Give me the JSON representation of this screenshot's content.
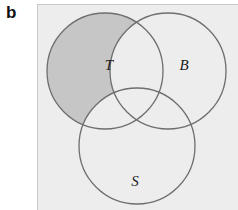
{
  "figure": {
    "panel_letter": "b",
    "type": "venn-diagram-3-set",
    "background_color": "#ededed",
    "page_background_color": "#ffffff"
  },
  "venn": {
    "stroke_color": "#6e6e6e",
    "stroke_width": 1.3,
    "unfilled_color": "#ededed",
    "highlight_color": "#c6c6c6",
    "sets": [
      {
        "id": "set-t",
        "label": "T",
        "label_x": 71,
        "label_y": 65,
        "cx": 67,
        "cy": 66,
        "r": 58,
        "highlighted": true
      },
      {
        "id": "set-b",
        "label": "B",
        "label_x": 146,
        "label_y": 65,
        "cx": 130,
        "cy": 66,
        "r": 58,
        "highlighted": false
      },
      {
        "id": "set-s",
        "label": "S",
        "label_x": 97,
        "label_y": 181,
        "cx": 99,
        "cy": 141,
        "r": 58,
        "highlighted": false
      }
    ]
  }
}
